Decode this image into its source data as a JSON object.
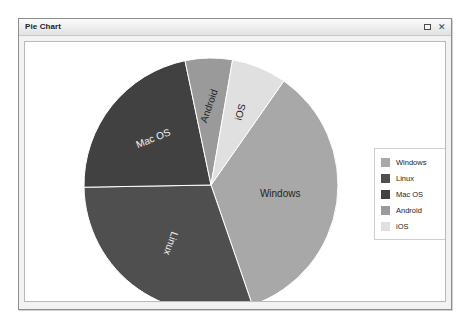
{
  "window": {
    "title": "Pie Chart",
    "controls": [
      {
        "name": "maximize-button",
        "glyph": ""
      },
      {
        "name": "close-button",
        "glyph": "✕"
      }
    ]
  },
  "legend": {
    "position": "right",
    "entries": [
      {
        "label": "Windows",
        "color": "#a8a8a8"
      },
      {
        "label": "Linux",
        "color": "#4f4f4f"
      },
      {
        "label": "Mac OS",
        "color": "#414141"
      },
      {
        "label": "Android",
        "color": "#9a9a9a"
      },
      {
        "label": "iOS",
        "color": "#e0e0e0"
      }
    ]
  },
  "chart_data": {
    "type": "pie",
    "title": "Pie Chart",
    "xlabel": "",
    "ylabel": "",
    "grid": false,
    "legend_position": "right",
    "center": {
      "x": 186,
      "y": 143
    },
    "radius": 127,
    "start_angle": -55,
    "direction": "clockwise",
    "categories": [
      "Windows",
      "Linux",
      "Mac OS",
      "Android",
      "iOS"
    ],
    "values": [
      35,
      30,
      22,
      6,
      7
    ],
    "colors": [
      "#a8a8a8",
      "#4f4f4f",
      "#414141",
      "#9a9a9a",
      "#e0e0e0"
    ],
    "slices": [
      {
        "label": "Windows",
        "value": 35,
        "color": "#a8a8a8",
        "start_deg": -55,
        "end_deg": 71,
        "label_color": "#1f1f1f",
        "label_rotation": 0,
        "label_r": 0.55
      },
      {
        "label": "Linux",
        "value": 30,
        "color": "#4f4f4f",
        "start_deg": -55,
        "end_deg": -163,
        "label_color": "#f2f2f2",
        "label_rotation": 110,
        "label_r": 0.56
      },
      {
        "label": "Mac OS",
        "value": 22,
        "color": "#414141",
        "start_deg": 197,
        "end_deg": 118,
        "label_color": "#f2f2f2",
        "label_rotation": -22,
        "label_r": 0.58
      },
      {
        "label": "Android",
        "value": 6,
        "color": "#9a9a9a",
        "start_deg": 118,
        "end_deg": 100,
        "label_color": "#1f1f1f",
        "label_rotation": -71,
        "label_r": 0.62
      },
      {
        "label": "iOS",
        "value": 7,
        "color": "#e0e0e0",
        "start_deg": 100,
        "end_deg": 71,
        "label_color": "#1f1f1f",
        "label_rotation": -76,
        "label_r": 0.62
      }
    ]
  }
}
